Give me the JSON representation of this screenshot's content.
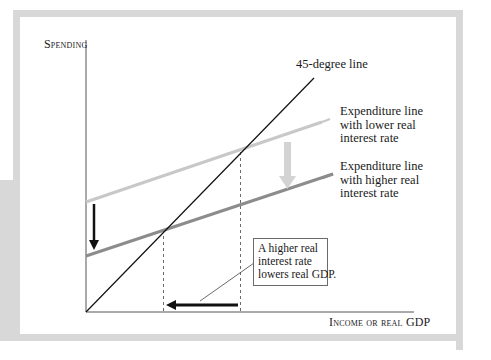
{
  "diagram": {
    "y_axis_label": "Spending",
    "x_axis_label": "Income or real GDP",
    "line_45_label": "45-degree line",
    "expenditure_lower": {
      "lines": [
        "Expenditure line",
        "with lower real",
        "interest rate"
      ]
    },
    "expenditure_higher": {
      "lines": [
        "Expenditure line",
        "with higher real",
        "interest rate"
      ]
    },
    "callout": {
      "lines": [
        "A  higher real",
        "interest rate",
        "lowers real GDP."
      ]
    }
  },
  "colors": {
    "frame": "#d8d8d8",
    "axis": "#555555",
    "line_45": "#111111",
    "expenditure_lower": "#c8c8c8",
    "expenditure_higher": "#8c8c8c",
    "shift_arrow_gray": "#d0d0d0",
    "arrow_black": "#111111"
  }
}
